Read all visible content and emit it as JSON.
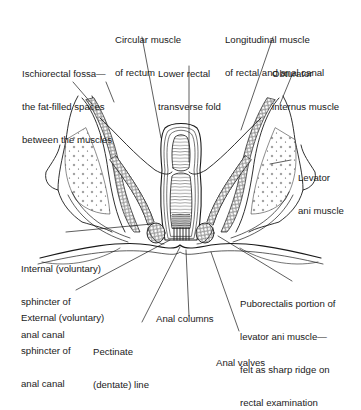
{
  "diagram": {
    "labels": {
      "circular_muscle": {
        "lines": [
          "Circular muscle",
          "of rectum"
        ]
      },
      "longitudinal_muscle": {
        "lines": [
          "Longitudinal muscle",
          "of rectal and anal canal"
        ]
      },
      "ischiorectal_fossa": {
        "lines": [
          "Ischiorectal fossa—",
          "the fat-filled spaces",
          "between the muscles"
        ]
      },
      "lower_rectal_fold": {
        "lines": [
          "Lower rectal",
          "transverse fold"
        ]
      },
      "obturator_internus": {
        "lines": [
          "Obturator",
          "internus muscle"
        ]
      },
      "levator_ani": {
        "lines": [
          "Levator",
          "ani muscle"
        ]
      },
      "internal_sphincter": {
        "lines": [
          "Internal (voluntary)",
          "sphincter of",
          "anal canal"
        ]
      },
      "external_sphincter": {
        "lines": [
          "External (voluntary)",
          "sphincter of",
          "anal canal"
        ]
      },
      "puborectalis": {
        "lines": [
          "Puborectalis portion of",
          "levator ani muscle—",
          "felt as sharp ridge on",
          "rectal examination"
        ]
      },
      "anal_columns": {
        "lines": [
          "Anal columns"
        ]
      },
      "pectinate_line": {
        "lines": [
          "Pectinate",
          "(dentate) line"
        ]
      },
      "anal_valves": {
        "lines": [
          "Anal valves"
        ]
      }
    },
    "colors": {
      "line": "#1a1a1a",
      "background": "#ffffff",
      "shading": "#888888"
    }
  }
}
